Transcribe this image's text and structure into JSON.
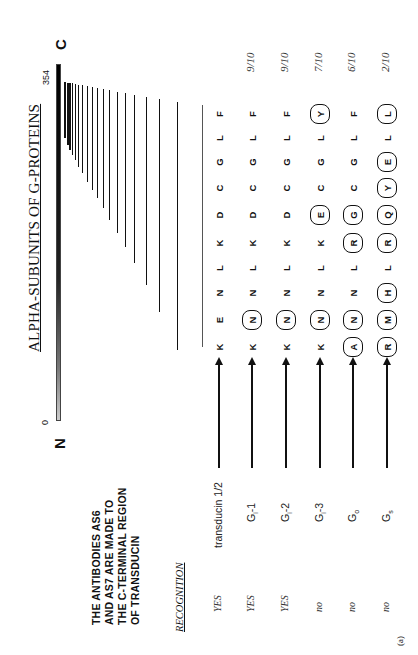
{
  "figure": {
    "title": "ALPHA-SUBUNITS OF G-PROTEINS",
    "panel_label": "(a)",
    "terminals": {
      "n": "N",
      "c": "C"
    },
    "scale": {
      "start": "0",
      "end": "354"
    },
    "note_lines": [
      "THE     ANTIBODIES     AS6",
      "AND  AS7  ARE  MADE  TO",
      "THE C-TERMINAL REGION",
      "OF TRANSDUCIN"
    ],
    "recognition_header": "RECOGNITION",
    "rows": [
      {
        "recognition": "YES",
        "protein": "transducin 1/2",
        "protein_base": "transducin 1/2",
        "protein_sub": "",
        "protein_suffix": "",
        "fraction": "",
        "residues": [
          {
            "aa": "K",
            "circled": false
          },
          {
            "aa": "E",
            "circled": false
          },
          {
            "aa": "N",
            "circled": false
          },
          {
            "aa": "L",
            "circled": false
          },
          {
            "aa": "K",
            "circled": false
          },
          {
            "aa": "D",
            "circled": false
          },
          {
            "aa": "C",
            "circled": false
          },
          {
            "aa": "G",
            "circled": false
          },
          {
            "aa": "L",
            "circled": false
          },
          {
            "aa": "F",
            "circled": false
          }
        ]
      },
      {
        "recognition": "YES",
        "protein": "Gi-1",
        "protein_base": "G",
        "protein_sub": "i",
        "protein_suffix": "-1",
        "fraction": "9/10",
        "residues": [
          {
            "aa": "K",
            "circled": false
          },
          {
            "aa": "N",
            "circled": true
          },
          {
            "aa": "N",
            "circled": false
          },
          {
            "aa": "L",
            "circled": false
          },
          {
            "aa": "K",
            "circled": false
          },
          {
            "aa": "D",
            "circled": false
          },
          {
            "aa": "C",
            "circled": false
          },
          {
            "aa": "G",
            "circled": false
          },
          {
            "aa": "L",
            "circled": false
          },
          {
            "aa": "F",
            "circled": false
          }
        ]
      },
      {
        "recognition": "YES",
        "protein": "Gi-2",
        "protein_base": "G",
        "protein_sub": "i",
        "protein_suffix": "-2",
        "fraction": "9/10",
        "residues": [
          {
            "aa": "K",
            "circled": false
          },
          {
            "aa": "N",
            "circled": true
          },
          {
            "aa": "N",
            "circled": false
          },
          {
            "aa": "L",
            "circled": false
          },
          {
            "aa": "K",
            "circled": false
          },
          {
            "aa": "D",
            "circled": false
          },
          {
            "aa": "C",
            "circled": false
          },
          {
            "aa": "G",
            "circled": false
          },
          {
            "aa": "L",
            "circled": false
          },
          {
            "aa": "F",
            "circled": false
          }
        ]
      },
      {
        "recognition": "no",
        "protein": "Gi-3",
        "protein_base": "G",
        "protein_sub": "i",
        "protein_suffix": "-3",
        "fraction": "7/10",
        "residues": [
          {
            "aa": "K",
            "circled": false
          },
          {
            "aa": "N",
            "circled": true
          },
          {
            "aa": "N",
            "circled": false
          },
          {
            "aa": "L",
            "circled": false
          },
          {
            "aa": "K",
            "circled": false
          },
          {
            "aa": "E",
            "circled": true
          },
          {
            "aa": "C",
            "circled": false
          },
          {
            "aa": "G",
            "circled": false
          },
          {
            "aa": "L",
            "circled": false
          },
          {
            "aa": "Y",
            "circled": true
          }
        ]
      },
      {
        "recognition": "no",
        "protein": "Go",
        "protein_base": "G",
        "protein_sub": "o",
        "protein_suffix": "",
        "fraction": "6/10",
        "residues": [
          {
            "aa": "A",
            "circled": true
          },
          {
            "aa": "N",
            "circled": true
          },
          {
            "aa": "N",
            "circled": false
          },
          {
            "aa": "L",
            "circled": false
          },
          {
            "aa": "R",
            "circled": true
          },
          {
            "aa": "G",
            "circled": true
          },
          {
            "aa": "C",
            "circled": false
          },
          {
            "aa": "G",
            "circled": false
          },
          {
            "aa": "L",
            "circled": false
          },
          {
            "aa": "F",
            "circled": false
          }
        ]
      },
      {
        "recognition": "no",
        "protein": "Gs",
        "protein_base": "G",
        "protein_sub": "s",
        "protein_suffix": "",
        "fraction": "2/10",
        "residues": [
          {
            "aa": "R",
            "circled": true
          },
          {
            "aa": "M",
            "circled": true
          },
          {
            "aa": "H",
            "circled": true
          },
          {
            "aa": "L",
            "circled": false
          },
          {
            "aa": "R",
            "circled": true
          },
          {
            "aa": "Q",
            "circled": true
          },
          {
            "aa": "Y",
            "circled": true
          },
          {
            "aa": "E",
            "circled": true
          },
          {
            "aa": "L",
            "circled": false
          },
          {
            "aa": "L",
            "circled": true
          }
        ]
      }
    ]
  }
}
